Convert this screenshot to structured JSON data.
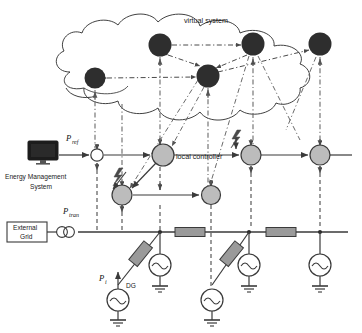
{
  "figure": {
    "background": "#ffffff"
  },
  "colors": {
    "line": "#3a3a3a",
    "cloud_stroke": "#2b2b2b",
    "virtual_node_fill": "#2e2e2e",
    "controller_fill": "#bcbcbc",
    "controller_stroke": "#3a3a3a",
    "impedance_fill": "#9a9a9a",
    "impedance_stroke": "#3a3a3a",
    "ems_screen": "#1c1c1c",
    "comm_line": "#6a6a6a",
    "text": "#1a1a1a"
  },
  "labels": {
    "virtual_system": "virtual system",
    "local_controller": "local controller",
    "ems_line1": "Energy Management",
    "ems_line2": "System",
    "external_grid_line1": "External",
    "external_grid_line2": "Grid",
    "dg": "DG",
    "p_ref_base": "P",
    "p_ref_sub": "ref",
    "p_tran_base": "P",
    "p_tran_sub": "tran",
    "p_i_base": "P",
    "p_i_sub": "i"
  },
  "layers": {
    "virtual": {
      "name": "virtual system cloud layer",
      "nodes": [
        {
          "id": "v1",
          "x": 95,
          "y": 78,
          "r": 10.5
        },
        {
          "id": "v2",
          "x": 160,
          "y": 45,
          "r": 11.5
        },
        {
          "id": "v3",
          "x": 208,
          "y": 76,
          "r": 11.5
        },
        {
          "id": "v4",
          "x": 253,
          "y": 44,
          "r": 11.5
        },
        {
          "id": "v5",
          "x": 320,
          "y": 44,
          "r": 11.5
        }
      ]
    },
    "control": {
      "name": "local controller layer",
      "upper_nodes": [
        {
          "id": "c0",
          "x": 97,
          "y": 155,
          "r": 6.2,
          "fill": "white"
        },
        {
          "id": "c1",
          "x": 163,
          "y": 155,
          "r": 11
        },
        {
          "id": "c2",
          "x": 251,
          "y": 155,
          "r": 10
        },
        {
          "id": "c3",
          "x": 320,
          "y": 155,
          "r": 10
        }
      ],
      "lower_nodes": [
        {
          "id": "c4",
          "x": 122,
          "y": 195,
          "r": 10
        },
        {
          "id": "c5",
          "x": 211,
          "y": 195,
          "r": 9.5
        }
      ]
    },
    "power": {
      "name": "physical power network layer",
      "bus_y": 232,
      "bus_x_start": 78,
      "bus_x_end": 345,
      "bus_nodes": [
        118,
        160,
        249,
        320
      ],
      "line_impedances": [
        {
          "x": 190,
          "y": 232,
          "w": 30,
          "h": 9
        },
        {
          "x": 281,
          "y": 232,
          "w": 30,
          "h": 9
        }
      ],
      "generators": [
        {
          "id": "g1",
          "x": 160,
          "y": 265,
          "r": 11,
          "grounded": true
        },
        {
          "id": "g2",
          "x": 249,
          "y": 265,
          "r": 11,
          "grounded": true
        },
        {
          "id": "g3",
          "x": 320,
          "y": 265,
          "r": 11,
          "grounded": true
        },
        {
          "id": "g4",
          "x": 118,
          "y": 300,
          "r": 11,
          "grounded": true,
          "label": "DG"
        },
        {
          "id": "g5",
          "x": 212,
          "y": 300,
          "r": 11,
          "grounded": true
        }
      ],
      "branch_impedances": [
        {
          "cx": 136,
          "cy": 272,
          "w": 11,
          "h": 24,
          "rot": 40
        },
        {
          "cx": 230,
          "cy": 272,
          "w": 11,
          "h": 24,
          "rot": 40
        }
      ],
      "transformer": {
        "x": 80,
        "y": 232,
        "label_base": "P",
        "label_sub": "tran"
      }
    }
  },
  "icons": {
    "ems_monitor": "monitor-icon",
    "transformer": "transformer-icon",
    "generator": "ac-source-icon",
    "ground": "ground-icon",
    "disturbance": "lightning-bolt-icon",
    "cloud": "cloud-icon"
  },
  "disturbances": [
    {
      "id": "d1",
      "x": 118,
      "y": 176,
      "note": "lightning bolt into lower controller"
    },
    {
      "id": "d2",
      "x": 236,
      "y": 138,
      "note": "lightning bolt into upper controller"
    }
  ],
  "legend_notes": {
    "solid_arrow": "control signal / power reference flow",
    "dash_dot_line": "communication link between layers",
    "dashed_arrow": "peer-to-peer information exchange in virtual system"
  }
}
